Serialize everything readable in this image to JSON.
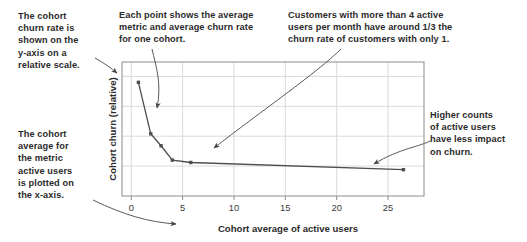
{
  "figure": {
    "annotations": [
      {
        "name": "annotation-y-axis-scale",
        "text": "The cohort\nchurn rate is\nshown on the\ny-axis on a\nrelative scale."
      },
      {
        "name": "annotation-each-point",
        "text": "Each point shows the average\nmetric and average churn rate\nfor one cohort."
      },
      {
        "name": "annotation-churn-comparison",
        "text": "Customers with more than 4 active\nusers per month have around 1/3 the\nchurn rate of customers with only 1."
      },
      {
        "name": "annotation-less-impact",
        "text": "Higher counts\nof active users\nhave less impact\non churn."
      },
      {
        "name": "annotation-x-axis-metric",
        "text": "The cohort\naverage for\nthe metric\nactive users\nis plotted on\nthe x-axis."
      }
    ],
    "colors": {
      "text": "#2b2b2b",
      "series": "#4d4d4d",
      "grid": "#d9d9d9",
      "frame": "#8c8c8c",
      "background": "#ffffff"
    }
  },
  "chart_data": {
    "type": "line",
    "title": "",
    "xlabel": "Cohort average of active users",
    "ylabel": "Cohort churn (relative)",
    "xlim": [
      -0.9,
      28.5
    ],
    "ylim": [
      0.0,
      1.12
    ],
    "xticks": [
      0,
      5,
      10,
      15,
      20,
      25
    ],
    "xticklabels": [
      "0",
      "5",
      "10",
      "15",
      "20",
      "25"
    ],
    "yticks": [
      0.25,
      0.5,
      0.75,
      1.0
    ],
    "yticklabels": [
      "",
      "",
      "",
      ""
    ],
    "grid": true,
    "legend": false,
    "markers": true,
    "series": [
      {
        "name": "Cohort churn vs active users",
        "x": [
          0.7,
          1.9,
          2.9,
          4.0,
          5.8,
          26.5
        ],
        "y": [
          0.95,
          0.52,
          0.42,
          0.3,
          0.28,
          0.22
        ]
      }
    ]
  }
}
